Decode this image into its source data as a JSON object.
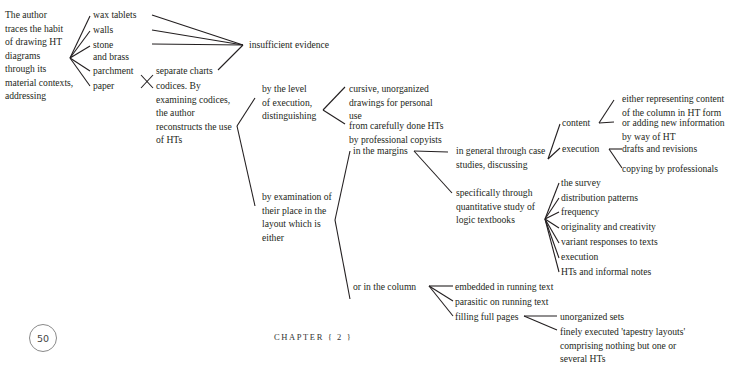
{
  "root": {
    "lines": [
      "The author",
      "traces the habit",
      "of drawing HT",
      "diagrams",
      "through its",
      "material contexts,",
      "addressing"
    ]
  },
  "materials": [
    "wax tablets",
    "walls",
    "stone",
    "and brass",
    "parchment",
    "paper"
  ],
  "insufficient": "insufficient evidence",
  "separate_charts": "separate charts",
  "codices": [
    "codices. By",
    "examining codices,",
    "the author",
    "reconstructs the use",
    "of HTs"
  ],
  "level": [
    "by the level",
    "of execution,",
    "distinguishing"
  ],
  "cursive": [
    "cursive, unorganized",
    "drawings for personal",
    "use"
  ],
  "careful": [
    "from carefully done HTs",
    "by professional copyists"
  ],
  "layout": [
    "by examination of",
    "their place in the",
    "layout which is",
    "either"
  ],
  "margins": "in the margins",
  "general": [
    "in general through case",
    "studies, discussing"
  ],
  "content": "content",
  "content_children": {
    "either": [
      "either representing content",
      "of the column in HT form"
    ],
    "adding": [
      "or adding new information",
      "by way of HT"
    ]
  },
  "execution": "execution",
  "execution_children": [
    "drafts and revisions",
    "copying by professionals"
  ],
  "specific": [
    "specifically through",
    "quantitative study of",
    "logic textbooks"
  ],
  "specific_children": [
    "the survey",
    "distribution patterns",
    "frequency",
    "originality and creativity",
    "variant responses to texts",
    "execution",
    "HTs and informal notes"
  ],
  "column": "or in the column",
  "column_children": [
    "embedded in running text",
    "parasitic on running text",
    "filling full pages"
  ],
  "fullpage_children": {
    "unorganized": "unorganized sets",
    "finely": [
      "finely executed 'tapestry layouts'",
      "comprising nothing but one or",
      "several HTs"
    ]
  },
  "footer": {
    "page_number": "50",
    "chapter": "CHAPTER { 2 }"
  }
}
